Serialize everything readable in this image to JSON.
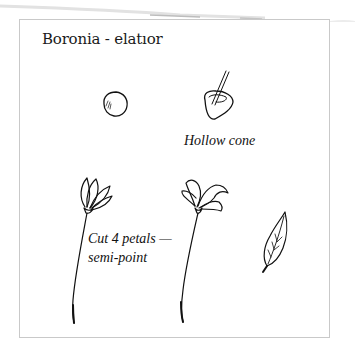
{
  "title": "Boronia - elatıor",
  "labels": {
    "hollow_cone": "Hollow cone",
    "cut_petals_line1": "Cut 4 petals —",
    "cut_petals_line2": "semi-point"
  },
  "illustrations": [
    {
      "name": "ball",
      "description": "small ball of paste"
    },
    {
      "name": "hollow-cone",
      "description": "cone hollowed with a stick"
    },
    {
      "name": "bud-flower",
      "description": "closed flower with 4 petals on wire stem"
    },
    {
      "name": "open-flower",
      "description": "open flower with curled petals on wire stem"
    },
    {
      "name": "leaf",
      "description": "single veined leaf"
    }
  ],
  "colors": {
    "ink": "#111111",
    "frame": "#c9c9c9",
    "background": "#ffffff"
  }
}
